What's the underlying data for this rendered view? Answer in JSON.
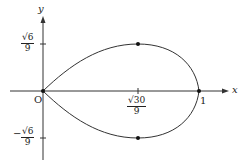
{
  "axes": {
    "x_label": "x",
    "y_label": "y",
    "origin_label": "O"
  },
  "ticks": {
    "y_top": {
      "num": "√6",
      "den": "9",
      "sign": ""
    },
    "y_bottom": {
      "num": "√6",
      "den": "9",
      "sign": "−"
    },
    "x_mid": {
      "num": "√30",
      "den": "9"
    },
    "x_one": "1"
  },
  "points": [
    {
      "name": "origin",
      "x": 0,
      "y": 0
    },
    {
      "name": "top",
      "x": "√30/9",
      "y": "√6/9"
    },
    {
      "name": "bottom",
      "x": "√30/9",
      "y": "−√6/9"
    },
    {
      "name": "right",
      "x": 1,
      "y": 0
    }
  ]
}
